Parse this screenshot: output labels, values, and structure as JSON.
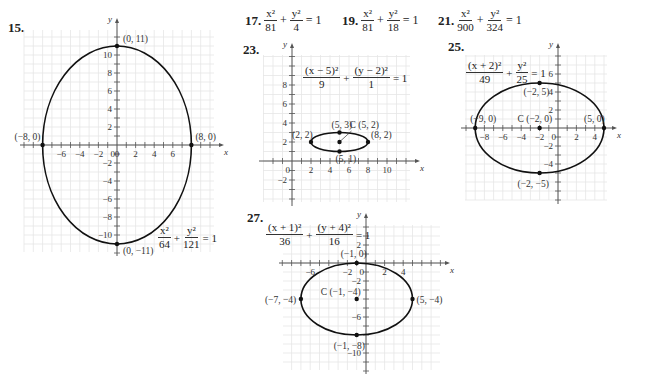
{
  "problems": {
    "p15": {
      "number": "15."
    },
    "p17": {
      "number": "17.",
      "num1": "x²",
      "den1": "81",
      "op": "+",
      "num2": "y²",
      "den2": "4",
      "rhs": "= 1"
    },
    "p19": {
      "number": "19.",
      "num1": "x²",
      "den1": "81",
      "op": "+",
      "num2": "y²",
      "den2": "18",
      "rhs": "= 1"
    },
    "p21": {
      "number": "21.",
      "num1": "x²",
      "den1": "900",
      "op": "+",
      "num2": "y²",
      "den2": "324",
      "rhs": "= 1"
    },
    "p23": {
      "number": "23."
    },
    "p25": {
      "number": "25."
    },
    "p27": {
      "number": "27."
    }
  },
  "chart_data": [
    {
      "id": "15",
      "type": "line",
      "title": "x²/64 + y²/121 = 1",
      "equation": {
        "num1": "x²",
        "den1": "64",
        "num2": "y²",
        "den2": "121",
        "rhs": "= 1"
      },
      "xlabel": "x",
      "ylabel": "y",
      "xlim": [
        -10,
        10
      ],
      "ylim": [
        -12,
        12
      ],
      "xticks": [
        -6,
        -4,
        -2,
        0,
        2,
        4,
        6
      ],
      "yticks": [
        -10,
        -8,
        -6,
        -4,
        -2,
        2,
        4,
        6,
        8,
        10
      ],
      "grid": true,
      "ellipse": {
        "center": [
          0,
          0
        ],
        "a": 8,
        "b": 11
      },
      "points": [
        {
          "label": "(0, 11)",
          "x": 0,
          "y": 11
        },
        {
          "label": "(0, −11)",
          "x": 0,
          "y": -11
        },
        {
          "label": "(−8, 0)",
          "x": -8,
          "y": 0
        },
        {
          "label": "(8, 0)",
          "x": 8,
          "y": 0
        }
      ]
    },
    {
      "id": "23",
      "type": "line",
      "title": "(x − 5)²/9 + (y − 2)²/1 = 1",
      "equation": {
        "num1": "(x − 5)²",
        "den1": "9",
        "num2": "(y − 2)²",
        "den2": "1",
        "rhs": "= 1"
      },
      "xlabel": "x",
      "ylabel": "y",
      "xlim": [
        -2,
        13
      ],
      "ylim": [
        -4,
        11
      ],
      "xticks": [
        2,
        4,
        6,
        8,
        10
      ],
      "yticks": [
        -2,
        2,
        4,
        6,
        8
      ],
      "grid": true,
      "ellipse": {
        "center": [
          5,
          2
        ],
        "a": 3,
        "b": 1
      },
      "points": [
        {
          "label": "(2, 2)",
          "x": 2,
          "y": 2
        },
        {
          "label": "(8, 2)",
          "x": 8,
          "y": 2
        },
        {
          "label": "(5, 3)",
          "x": 5,
          "y": 3
        },
        {
          "label": "(5, 1)",
          "x": 5,
          "y": 1
        },
        {
          "label": "C (5, 2)",
          "x": 5,
          "y": 2
        }
      ]
    },
    {
      "id": "25",
      "type": "line",
      "title": "(x + 2)²/49 + y²/25 = 1",
      "equation": {
        "num1": "(x + 2)²",
        "den1": "49",
        "num2": "y²",
        "den2": "25",
        "rhs": "= 1"
      },
      "xlabel": "x",
      "ylabel": "y",
      "xlim": [
        -10,
        6
      ],
      "ylim": [
        -8,
        8
      ],
      "xticks": [
        -8,
        -6,
        -4,
        -2,
        2,
        4
      ],
      "yticks": [
        -4,
        -2,
        2,
        4,
        6
      ],
      "grid": true,
      "ellipse": {
        "center": [
          -2,
          0
        ],
        "a": 7,
        "b": 5
      },
      "points": [
        {
          "label": "(−2, 5)",
          "x": -2,
          "y": 5
        },
        {
          "label": "(−2, −5)",
          "x": -2,
          "y": -5
        },
        {
          "label": "(−9, 0)",
          "x": -9,
          "y": 0
        },
        {
          "label": "(5, 0)",
          "x": 5,
          "y": 0
        },
        {
          "label": "C (−2, 0)",
          "x": -2,
          "y": 0
        }
      ]
    },
    {
      "id": "27",
      "type": "line",
      "title": "(x + 1)²/36 + (y + 4)²/16 = 1",
      "equation": {
        "num1": "(x + 1)²",
        "den1": "36",
        "num2": "(y + 4)²",
        "den2": "16",
        "rhs": "= 1"
      },
      "xlabel": "x",
      "ylabel": "y",
      "xlim": [
        -9,
        8
      ],
      "ylim": [
        -12,
        4
      ],
      "xticks": [
        -6,
        -2,
        2,
        4
      ],
      "yticks": [
        -10,
        -6,
        -2,
        2
      ],
      "grid": true,
      "ellipse": {
        "center": [
          -1,
          -4
        ],
        "a": 6,
        "b": 4
      },
      "points": [
        {
          "label": "(−1, 0)",
          "x": -1,
          "y": 0
        },
        {
          "label": "(−1, −8)",
          "x": -1,
          "y": -8
        },
        {
          "label": "(−7, −4)",
          "x": -7,
          "y": -4
        },
        {
          "label": "(5, −4)",
          "x": 5,
          "y": -4
        },
        {
          "label": "C (−1, −4)",
          "x": -1,
          "y": -4
        }
      ]
    }
  ]
}
